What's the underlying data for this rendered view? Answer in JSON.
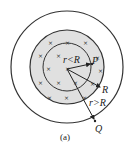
{
  "diagram": {
    "caption": "(a)",
    "labels": {
      "inner_radius": "r<R",
      "point_inside": "P",
      "region_radius": "R",
      "outer_radius": "r>R",
      "point_outside": "Q"
    },
    "field_symbol": "×",
    "colors": {
      "region_fill": "#e0e0e0",
      "stroke": "#333333"
    }
  }
}
